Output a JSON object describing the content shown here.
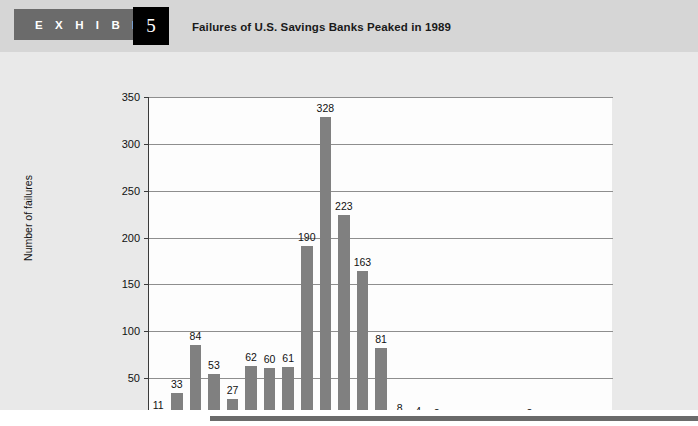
{
  "header": {
    "exhibit_word": "E X H I B I T",
    "exhibit_number": "5",
    "title": "Failures of U.S. Savings Banks Peaked in 1989",
    "band_color": "#d6d6d6",
    "tab_color": "#6b6b6b",
    "badge_color": "#000000"
  },
  "footer": {
    "rule_color": "#6b6b6b"
  },
  "chart_data": {
    "type": "bar",
    "title": "Failures of U.S. Savings Banks Peaked in 1989",
    "xlabel": "",
    "ylabel": "Number of failures",
    "categories": [
      "1980",
      "1981",
      "1982",
      "1983",
      "1984",
      "1985",
      "1986",
      "1987",
      "1988",
      "1989",
      "1990",
      "1991",
      "1992",
      "1993",
      "1994",
      "1995",
      "1996",
      "1997",
      "1998",
      "1999",
      "2000",
      "2001",
      "2002",
      "2003",
      "2004"
    ],
    "values": [
      11,
      33,
      84,
      53,
      27,
      62,
      60,
      61,
      190,
      328,
      223,
      163,
      81,
      8,
      4,
      2,
      1,
      0,
      0,
      1,
      2,
      1,
      1,
      1,
      1
    ],
    "data_labels": [
      "11",
      "33",
      "84",
      "53",
      "27",
      "62",
      "60",
      "61",
      "190",
      "328",
      "223",
      "163",
      "81",
      "8",
      "4",
      "2",
      "1",
      "0",
      "0",
      "1",
      "2",
      "1",
      "1",
      "1",
      "1"
    ],
    "ylim": [
      0,
      350
    ],
    "yticks": [
      0,
      50,
      100,
      150,
      200,
      250,
      300,
      350
    ],
    "ytick_labels": [
      "0",
      "50",
      "100",
      "150",
      "200",
      "250",
      "300",
      "350"
    ],
    "xtick_labels": [
      "1980",
      "1985",
      "1990",
      "1995",
      "2000",
      "2004"
    ],
    "xtick_categories": [
      "1980",
      "1985",
      "1990",
      "1995",
      "2000",
      "2004"
    ],
    "grid": true,
    "legend": false,
    "bar_color": "#808080",
    "plot_background": "#fdfdfd",
    "panel_background": "#e9e9e9"
  }
}
